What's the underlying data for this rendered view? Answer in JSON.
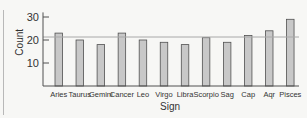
{
  "chart_data": {
    "type": "bar",
    "title": "",
    "xlabel": "Sign",
    "ylabel": "Count",
    "categories": [
      "Aries",
      "Taurus",
      "Gemini",
      "Cancer",
      "Leo",
      "Virgo",
      "Libra",
      "Scorpio",
      "Sag",
      "Cap",
      "Aqr",
      "Pisces"
    ],
    "values": [
      23,
      20,
      18,
      23,
      20,
      19,
      18,
      21,
      19,
      22,
      24,
      29
    ],
    "ylim": [
      0,
      32
    ],
    "yticks": [
      10,
      20,
      30
    ],
    "reference_line": {
      "value": 21.3,
      "label": ""
    },
    "grid": false,
    "legend": "none",
    "colors": {
      "bar_fill": "#c8c8c8",
      "bar_stroke": "#505050",
      "axis": "#505050",
      "reference": "#a8a8a8"
    }
  }
}
